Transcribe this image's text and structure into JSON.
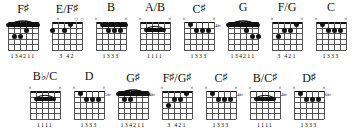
{
  "sheet": {
    "title": "Guitar Chord Diagram Chart",
    "background": "#ffffff",
    "ink": "#111111",
    "strings": 6,
    "frets": 5,
    "marker_open": "O",
    "marker_muted": "x"
  },
  "rows": [
    {
      "chords": [
        {
          "name_html": "F<span class=\"sh\">&#9839;</span>",
          "name_text": "F#",
          "fret_label": "",
          "markers": [
            "",
            "",
            "",
            "",
            "",
            ""
          ],
          "barre": {
            "from": 6,
            "to": 1,
            "fret": 1,
            "arc": true
          },
          "dots": [
            {
              "string": 5,
              "fret": 3
            },
            {
              "string": 4,
              "fret": 3
            },
            {
              "string": 3,
              "fret": 2
            }
          ],
          "fingers": "134211"
        },
        {
          "name_html": "E/F<span class=\"sh\">&#9839;</span>",
          "name_text": "E/F#",
          "fret_label": "",
          "markers": [
            "",
            "x",
            "",
            "",
            "O",
            "O"
          ],
          "barre": null,
          "dots": [
            {
              "string": 6,
              "fret": 2
            },
            {
              "string": 4,
              "fret": 2
            },
            {
              "string": 3,
              "fret": 1
            }
          ],
          "fingers": "3 42"
        },
        {
          "name_html": "B",
          "name_text": "B",
          "fret_label": "",
          "markers": [
            "x",
            "",
            "",
            "",
            "",
            "x"
          ],
          "barre": {
            "from": 5,
            "to": 1,
            "fret": 1,
            "arc": false
          },
          "dots": [
            {
              "string": 4,
              "fret": 2
            },
            {
              "string": 3,
              "fret": 2
            },
            {
              "string": 2,
              "fret": 2
            }
          ],
          "fingers": "1333"
        },
        {
          "name_html": "A/B",
          "name_text": "A/B",
          "fret_label": "",
          "markers": [
            "x",
            "",
            "",
            "",
            "",
            "x"
          ],
          "barre": {
            "from": 5,
            "to": 2,
            "fret": 2,
            "arc": true
          },
          "dots": [],
          "fingers": "1111"
        },
        {
          "name_html": "C<span class=\"sh\">&#9839;</span>",
          "name_text": "C#",
          "fret_label": "4fr",
          "markers": [
            "x",
            "",
            "",
            "",
            "",
            "x"
          ],
          "barre": null,
          "dots": [
            {
              "string": 5,
              "fret": 1
            },
            {
              "string": 4,
              "fret": 2
            },
            {
              "string": 3,
              "fret": 2
            },
            {
              "string": 2,
              "fret": 2
            }
          ],
          "fingers": "1333"
        },
        {
          "name_html": "G",
          "name_text": "G",
          "fret_label": "",
          "markers": [
            "",
            "",
            "",
            "",
            "",
            ""
          ],
          "barre": {
            "from": 6,
            "to": 1,
            "fret": 1,
            "arc": true
          },
          "dots": [
            {
              "string": 3,
              "fret": 2
            },
            {
              "string": 2,
              "fret": 3
            },
            {
              "string": 1,
              "fret": 3
            }
          ],
          "fingers": "134211"
        },
        {
          "name_html": "F/G",
          "name_text": "F/G",
          "fret_label": "",
          "markers": [
            "x",
            "",
            "",
            "",
            "",
            "x"
          ],
          "barre": null,
          "dots": [
            {
              "string": 5,
              "fret": 3
            },
            {
              "string": 4,
              "fret": 2
            },
            {
              "string": 3,
              "fret": 2
            },
            {
              "string": 2,
              "fret": 1
            }
          ],
          "fingers": "3 421"
        },
        {
          "name_html": "C",
          "name_text": "C",
          "fret_label": "",
          "markers": [
            "x",
            "",
            "",
            "",
            "",
            "x"
          ],
          "barre": null,
          "dots": [
            {
              "string": 5,
              "fret": 1
            },
            {
              "string": 4,
              "fret": 2
            },
            {
              "string": 3,
              "fret": 2
            },
            {
              "string": 2,
              "fret": 2
            }
          ],
          "fingers": "1333"
        }
      ]
    },
    {
      "chords": [
        {
          "name_html": "B<span class=\"fl\">&#9837;</span>/C",
          "name_text": "Bb/C",
          "fret_label": "",
          "markers": [
            "x",
            "",
            "",
            "",
            "",
            "x"
          ],
          "barre": {
            "from": 5,
            "to": 2,
            "fret": 2,
            "arc": true
          },
          "dots": [],
          "fingers": "1111"
        },
        {
          "name_html": "D",
          "name_text": "D",
          "fret_label": "5fr",
          "markers": [
            "x",
            "",
            "",
            "",
            "",
            "x"
          ],
          "barre": null,
          "dots": [
            {
              "string": 5,
              "fret": 1
            },
            {
              "string": 4,
              "fret": 2
            },
            {
              "string": 3,
              "fret": 2
            },
            {
              "string": 2,
              "fret": 2
            }
          ],
          "fingers": "1333"
        },
        {
          "name_html": "G<span class=\"sh\">&#9839;</span>",
          "name_text": "G#",
          "fret_label": "4fr",
          "markers": [
            "",
            "",
            "",
            "",
            "",
            ""
          ],
          "barre": {
            "from": 6,
            "to": 1,
            "fret": 1,
            "arc": true
          },
          "dots": [
            {
              "string": 5,
              "fret": 2
            },
            {
              "string": 4,
              "fret": 2
            },
            {
              "string": 3,
              "fret": 1
            }
          ],
          "fingers": "134211"
        },
        {
          "name_html": "F<span class=\"sh\">&#9839;</span>/G<span class=\"sh\">&#9839;</span>",
          "name_text": "F#/G#",
          "fret_label": "",
          "markers": [
            "x",
            "",
            "",
            "",
            "",
            "x"
          ],
          "barre": null,
          "dots": [
            {
              "string": 5,
              "fret": 3
            },
            {
              "string": 4,
              "fret": 2
            },
            {
              "string": 3,
              "fret": 2
            },
            {
              "string": 2,
              "fret": 1
            }
          ],
          "fingers": "3 421"
        },
        {
          "name_html": "C<span class=\"sh\">&#9839;</span>",
          "name_text": "C#",
          "fret_label": "4fr",
          "markers": [
            "x",
            "",
            "",
            "",
            "",
            "x"
          ],
          "barre": null,
          "dots": [
            {
              "string": 5,
              "fret": 1
            },
            {
              "string": 4,
              "fret": 2
            },
            {
              "string": 3,
              "fret": 2
            },
            {
              "string": 2,
              "fret": 2
            }
          ],
          "fingers": "1333"
        },
        {
          "name_html": "B/C<span class=\"sh\">&#9839;</span>",
          "name_text": "B/C#",
          "fret_label": "4fr",
          "markers": [
            "x",
            "",
            "",
            "",
            "",
            "x"
          ],
          "barre": {
            "from": 5,
            "to": 2,
            "fret": 2,
            "arc": true
          },
          "dots": [],
          "fingers": "1111"
        },
        {
          "name_html": "D<span class=\"sh\">&#9839;</span>",
          "name_text": "D#",
          "fret_label": "6fr",
          "markers": [
            "x",
            "",
            "",
            "",
            "",
            "x"
          ],
          "barre": null,
          "dots": [
            {
              "string": 5,
              "fret": 1
            },
            {
              "string": 4,
              "fret": 2
            },
            {
              "string": 3,
              "fret": 2
            },
            {
              "string": 2,
              "fret": 2
            }
          ],
          "fingers": "1333"
        }
      ]
    }
  ]
}
